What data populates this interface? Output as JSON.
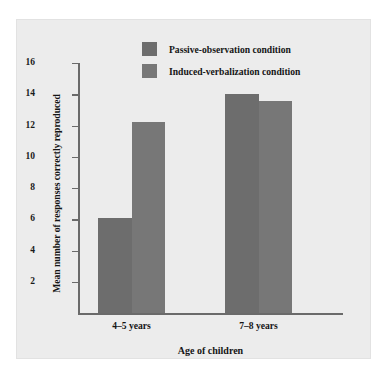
{
  "chart_data": {
    "type": "bar",
    "title": "",
    "xlabel": "Age of children",
    "ylabel": "Mean number of responses correctly reproduced",
    "categories": [
      "4–5 years",
      "7–8 years"
    ],
    "series": [
      {
        "name": "Passive-observation condition",
        "values": [
          6.1,
          14.0
        ],
        "color": "#6d6d6d"
      },
      {
        "name": "Induced-verbalization condition",
        "values": [
          12.2,
          13.6
        ],
        "color": "#777777"
      }
    ],
    "ylim": [
      0,
      16
    ],
    "yticks": [
      2,
      4,
      6,
      8,
      10,
      12,
      14,
      16
    ],
    "ytick_labels": [
      "2",
      "4",
      "6",
      "8",
      "10",
      "12",
      "14",
      "16"
    ],
    "grid": false,
    "legend_position": "top-center",
    "background_color": "#ececec",
    "axis_color": "#6a6a6a"
  },
  "legend": {
    "entries": [
      {
        "label": "Passive-observation condition"
      },
      {
        "label": "Induced-verbalization condition"
      }
    ]
  },
  "axes": {
    "x_title": "Age of children",
    "y_title": "Mean number of responses correctly reproduced"
  }
}
